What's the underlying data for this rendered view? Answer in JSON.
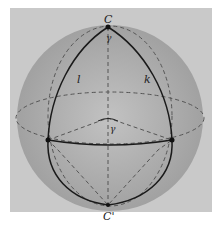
{
  "diagram": {
    "type": "sphere-geometry",
    "labels": {
      "top_pole": "C",
      "bottom_pole": "C'",
      "great_circle_left": "l",
      "great_circle_right": "k",
      "angle_at_top": "γ",
      "angle_at_center": "γ"
    },
    "colors": {
      "background": "#c9c9c9",
      "sphere": "#a8a8a8",
      "lines": "#1a1a1a",
      "dashed": "#555555"
    }
  }
}
